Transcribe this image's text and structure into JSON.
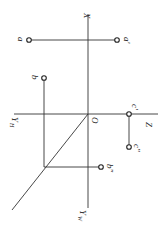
{
  "diagram": {
    "type": "orthographic-projection",
    "orientation": "rotated-90-clockwise",
    "colors": {
      "line": "#333333",
      "text": "#222222",
      "background": "#ffffff"
    },
    "axes": {
      "x": {
        "label": "X"
      },
      "z": {
        "label": "Z"
      },
      "yh": {
        "label": "Y",
        "sub": "H"
      },
      "yw": {
        "label": "Y",
        "sub": "W"
      },
      "origin": {
        "label": "O"
      }
    },
    "points": {
      "a": {
        "label": "a"
      },
      "a_prime": {
        "label": "a'"
      },
      "b": {
        "label": "b"
      },
      "b_dprime": {
        "label": "b\""
      },
      "c_prime": {
        "label": "c'"
      },
      "c_dprime": {
        "label": "c\""
      }
    }
  }
}
